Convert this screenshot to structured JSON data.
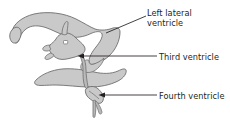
{
  "figure": {
    "background_color": "#ffffff"
  },
  "colors": {
    "ventricle_fill": "#c9c9c9",
    "ventricle_stroke": "#6e6e6e",
    "aqueduct_fill": "#b9b9b9",
    "leader_line": "#231f20",
    "label_text": "#231f20",
    "foramen_fill": "#ffffff"
  },
  "labels": [
    {
      "id": "left-lateral-ventricle",
      "text": "Left lateral\nventricle",
      "line1": "Left lateral",
      "line2": "ventricle",
      "leader": {
        "type": "diagonal",
        "from_x": 146,
        "from_y": 16,
        "to_x": 106,
        "to_y": 33
      }
    },
    {
      "id": "third-ventricle",
      "text": "Third ventricle",
      "line1": "Third ventricle",
      "line2": "",
      "leader": {
        "type": "arrow",
        "from_x": 157,
        "from_y": 56,
        "to_x": 78,
        "to_y": 56
      }
    },
    {
      "id": "fourth-ventricle",
      "text": "Fourth ventricle",
      "line1": "Fourth ventricle",
      "line2": "",
      "leader": {
        "type": "arrow",
        "from_x": 157,
        "from_y": 95,
        "to_x": 98,
        "to_y": 95
      }
    }
  ],
  "structures": [
    {
      "id": "lateral-ventricle",
      "name": "Left lateral ventricle"
    },
    {
      "id": "third-ventricle",
      "name": "Third ventricle"
    },
    {
      "id": "fourth-ventricle",
      "name": "Fourth ventricle"
    },
    {
      "id": "cerebral-aqueduct",
      "name": "Cerebral aqueduct"
    },
    {
      "id": "interventricular-foramen",
      "name": "Interventricular foramen"
    },
    {
      "id": "temporal-horn",
      "name": "Temporal horn"
    },
    {
      "id": "central-canal",
      "name": "Central canal"
    }
  ]
}
